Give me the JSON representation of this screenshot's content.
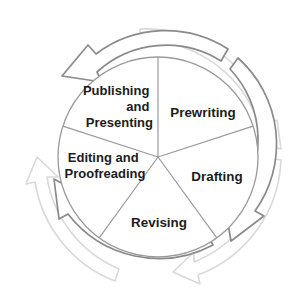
{
  "diagram": {
    "type": "cycle-diagram",
    "direction": "counter-clockwise",
    "center": {
      "x": 158,
      "y": 157
    },
    "pie_radius": 100,
    "colors": {
      "background": "#ffffff",
      "pie_outline": "#9a9a9a",
      "wedge_divider": "#9a9a9a",
      "inner_arrow_ring": "#8a8a8a",
      "outer_arrow_ring": "#d9d9d9",
      "label_text": "#1c1c1c"
    },
    "segments": [
      {
        "id": "prewriting",
        "label": "Prewriting",
        "lines": [
          "Prewriting"
        ],
        "align": "middle",
        "order": 1,
        "start_angle_deg": -90,
        "end_angle_deg": -18,
        "label_x": 203,
        "label_y": 112
      },
      {
        "id": "drafting",
        "label": "Drafting",
        "lines": [
          "Drafting"
        ],
        "align": "middle",
        "order": 2,
        "start_angle_deg": -18,
        "end_angle_deg": 54,
        "label_x": 218,
        "label_y": 176
      },
      {
        "id": "revising",
        "label": "Revising",
        "lines": [
          "Revising"
        ],
        "align": "middle",
        "order": 3,
        "start_angle_deg": 54,
        "end_angle_deg": 126,
        "label_x": 159,
        "label_y": 225
      },
      {
        "id": "editing-and-proofreading",
        "label": "Editing and Proofreading",
        "lines": [
          "Editing and",
          "Proofreading"
        ],
        "align": "middle",
        "order": 4,
        "start_angle_deg": 126,
        "end_angle_deg": 198,
        "label_x": 106,
        "label_y": 162
      },
      {
        "id": "publishing-and-presenting",
        "label": "Publishing and Presenting",
        "lines": [
          "Publishing",
          "and",
          "Presenting"
        ],
        "align": "end",
        "order": 5,
        "start_angle_deg": 198,
        "end_angle_deg": 270,
        "label_x": 152,
        "label_y": 91
      }
    ],
    "arrows": {
      "inner_ring": {
        "color": "#8a8a8a",
        "count": 3,
        "description": "three curved counter-clockwise arrows forming a broken ring just outside the pie"
      },
      "outer_ring": {
        "color": "#d9d9d9",
        "count": 3,
        "description": "three curved counter-clockwise arrows forming a broken outer ring, offset from the inner arrows"
      }
    }
  }
}
